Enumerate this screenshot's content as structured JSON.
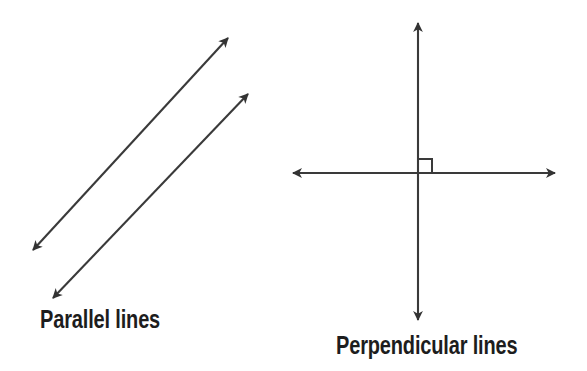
{
  "figure": {
    "background_color": "#ffffff",
    "stroke_color": "#3a3a3a",
    "text_color": "#1d1d1d",
    "width": 587,
    "height": 371
  },
  "diagrams": [
    {
      "id": "parallel",
      "label": "Parallel lines",
      "label_position": {
        "x": 40,
        "y": 307
      },
      "description": "Two parallel double-headed arrows pointing up-right and down-left",
      "lines": [
        {
          "name": "parallel-line-1",
          "x1": 33,
          "y1": 250,
          "x2": 228,
          "y2": 38,
          "arrow_start": true,
          "arrow_end": true
        },
        {
          "name": "parallel-line-2",
          "x1": 53,
          "y1": 298,
          "x2": 248,
          "y2": 94,
          "arrow_start": true,
          "arrow_end": true
        }
      ]
    },
    {
      "id": "perpendicular",
      "label": "Perpendicular lines",
      "label_position": {
        "x": 336,
        "y": 333
      },
      "description": "A vertical and a horizontal double-headed arrow crossing at a right angle, marked with a square",
      "lines": [
        {
          "name": "perpendicular-vertical-line",
          "x1": 418,
          "y1": 23,
          "x2": 418,
          "y2": 320,
          "arrow_start": true,
          "arrow_end": true
        },
        {
          "name": "perpendicular-horizontal-line",
          "x1": 293,
          "y1": 173,
          "x2": 555,
          "y2": 173,
          "arrow_start": true,
          "arrow_end": true
        }
      ],
      "right_angle_marker": {
        "name": "right-angle-square",
        "x": 418,
        "y": 159,
        "size": 14,
        "quadrant": "upper-right"
      },
      "intersection": {
        "x": 418,
        "y": 173
      }
    }
  ]
}
